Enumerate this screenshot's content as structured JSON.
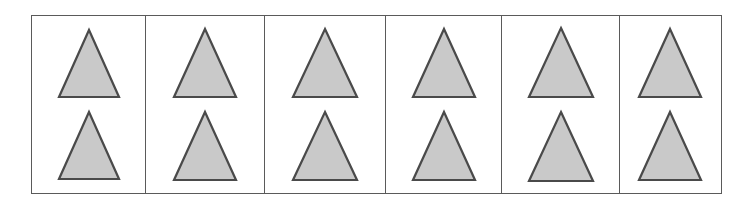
{
  "figure": {
    "kind": "shape-grid",
    "background_color": "#ffffff",
    "border_color": "#5a5a5a",
    "columns": 6,
    "rows": 2,
    "total_shapes": 12
  },
  "shape": {
    "name": "triangle",
    "orientation": "up",
    "fill_color": "#c9c9c9",
    "outline_color": "#4a4a4a",
    "base_width": 66,
    "height": 72
  },
  "cells": [
    {
      "index": 1,
      "label": "cell-1",
      "width": 114,
      "shapes": [
        {
          "row": 1,
          "name": "triangle",
          "width": 64,
          "height": 71
        },
        {
          "row": 2,
          "name": "triangle",
          "width": 64,
          "height": 71
        }
      ]
    },
    {
      "index": 2,
      "label": "cell-2",
      "width": 119,
      "shapes": [
        {
          "row": 1,
          "name": "triangle",
          "width": 66,
          "height": 72
        },
        {
          "row": 2,
          "name": "triangle",
          "width": 66,
          "height": 72
        }
      ]
    },
    {
      "index": 3,
      "label": "cell-3",
      "width": 121,
      "shapes": [
        {
          "row": 1,
          "name": "triangle",
          "width": 68,
          "height": 72
        },
        {
          "row": 2,
          "name": "triangle",
          "width": 68,
          "height": 72
        }
      ]
    },
    {
      "index": 4,
      "label": "cell-4",
      "width": 116,
      "shapes": [
        {
          "row": 1,
          "name": "triangle",
          "width": 66,
          "height": 72
        },
        {
          "row": 2,
          "name": "triangle",
          "width": 66,
          "height": 72
        }
      ]
    },
    {
      "index": 5,
      "label": "cell-5",
      "width": 118,
      "shapes": [
        {
          "row": 1,
          "name": "triangle",
          "width": 68,
          "height": 73
        },
        {
          "row": 2,
          "name": "triangle",
          "width": 68,
          "height": 73
        }
      ]
    },
    {
      "index": 6,
      "label": "cell-6",
      "width": 103,
      "shapes": [
        {
          "row": 1,
          "name": "triangle",
          "width": 66,
          "height": 72
        },
        {
          "row": 2,
          "name": "triangle",
          "width": 66,
          "height": 72
        }
      ]
    }
  ]
}
